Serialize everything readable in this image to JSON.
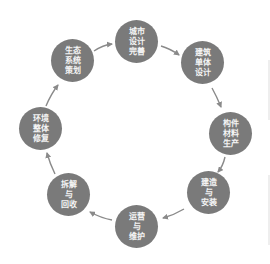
{
  "diagram": {
    "type": "cycle",
    "node_color": "#7a7a7a",
    "text_color": "#f4f4f4",
    "arrow_color": "#8a8a8a",
    "background": "#ffffff",
    "nodes": [
      {
        "id": "urban-design",
        "lines": [
          "城市",
          "设计",
          "完善"
        ],
        "cx": 136,
        "cy": 41
      },
      {
        "id": "building-design",
        "lines": [
          "建筑",
          "单体",
          "设计"
        ],
        "cx": 202,
        "cy": 62
      },
      {
        "id": "component-production",
        "lines": [
          "构件",
          "材料",
          "生产"
        ],
        "cx": 230,
        "cy": 133
      },
      {
        "id": "construction",
        "lines": [
          "建造",
          "与",
          "安装"
        ],
        "cx": 208,
        "cy": 192
      },
      {
        "id": "operation",
        "lines": [
          "运营",
          "与",
          "维护"
        ],
        "cx": 136,
        "cy": 226
      },
      {
        "id": "dismantle",
        "lines": [
          "拆解",
          "与",
          "回收"
        ],
        "cx": 68,
        "cy": 194
      },
      {
        "id": "environment",
        "lines": [
          "环境",
          "整体",
          "修复"
        ],
        "cx": 40,
        "cy": 128
      },
      {
        "id": "ecosystem",
        "lines": [
          "生态",
          "系统",
          "策划"
        ],
        "cx": 72,
        "cy": 60
      }
    ],
    "edges": [
      {
        "from": "urban-design",
        "to": "building-design"
      },
      {
        "from": "building-design",
        "to": "component-production"
      },
      {
        "from": "component-production",
        "to": "construction"
      },
      {
        "from": "construction",
        "to": "operation"
      },
      {
        "from": "operation",
        "to": "dismantle"
      },
      {
        "from": "dismantle",
        "to": "environment"
      },
      {
        "from": "environment",
        "to": "ecosystem"
      },
      {
        "from": "ecosystem",
        "to": "urban-design"
      }
    ]
  }
}
